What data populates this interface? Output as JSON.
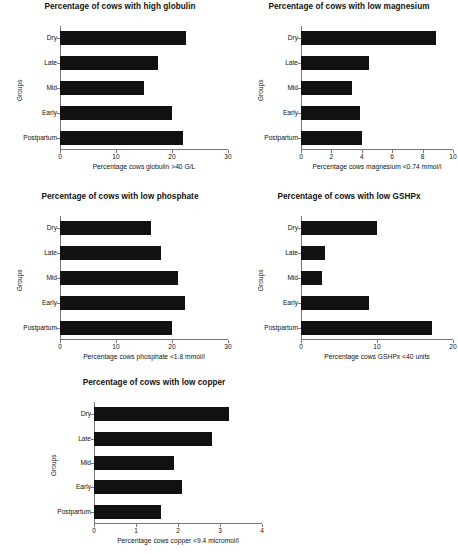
{
  "figure": {
    "groups_axis_label": "Groups",
    "categories": [
      "Dry",
      "Late",
      "Mid",
      "Early",
      "Postpartum"
    ]
  },
  "chart_data": [
    {
      "type": "bar",
      "orientation": "horizontal",
      "title": "Percentage of cows with high globulin",
      "xlabel": "Percentage cows globulin >40 G/L",
      "ylabel": "Groups",
      "categories": [
        "Dry",
        "Late",
        "Mid",
        "Early",
        "Postpartum"
      ],
      "values": [
        22.5,
        17.5,
        15.0,
        20.0,
        22.0
      ],
      "xlim": [
        0,
        30
      ],
      "xticks": [
        0,
        10,
        20,
        30
      ],
      "xtick_labels": [
        "0",
        "10",
        "20",
        "30"
      ],
      "grid": false,
      "legend": "none",
      "bar_color": "#111111"
    },
    {
      "type": "bar",
      "orientation": "horizontal",
      "title": "Percentage of cows with low magnesium",
      "xlabel": "Percentage cows magnesium <0.74 mmol/l",
      "ylabel": "Groups",
      "categories": [
        "Dry",
        "Late",
        "Mid",
        "Early",
        "Postpartum"
      ],
      "values": [
        8.9,
        4.5,
        3.35,
        3.85,
        4.0
      ],
      "xlim": [
        0,
        10
      ],
      "xticks": [
        0,
        2,
        4,
        6,
        8,
        10
      ],
      "xtick_labels": [
        "0",
        "2",
        "4",
        "6",
        "8",
        "10"
      ],
      "grid": false,
      "legend": "none",
      "bar_color": "#111111"
    },
    {
      "type": "bar",
      "orientation": "horizontal",
      "title": "Percentage of cows with low phosphate",
      "xlabel": "Percentage cows phosphate <1.8 mmol/l",
      "ylabel": "Groups",
      "categories": [
        "Dry",
        "Late",
        "Mid",
        "Early",
        "Postpartum"
      ],
      "values": [
        16.2,
        18.1,
        21.0,
        22.4,
        20.0
      ],
      "xlim": [
        0,
        30
      ],
      "xticks": [
        0,
        10,
        20,
        30
      ],
      "xtick_labels": [
        "0",
        "10",
        "20",
        "30"
      ],
      "grid": false,
      "legend": "none",
      "bar_color": "#111111"
    },
    {
      "type": "bar",
      "orientation": "horizontal",
      "title": "Percentage of cows with low GSHPx",
      "xlabel": "Percentage cows GSHPx <40 units",
      "ylabel": "Groups",
      "categories": [
        "Dry",
        "Late",
        "Mid",
        "Early",
        "Postpartum"
      ],
      "values": [
        10.0,
        3.2,
        2.7,
        9.0,
        17.3
      ],
      "xlim": [
        0,
        20
      ],
      "xticks": [
        0,
        10,
        20
      ],
      "xtick_labels": [
        "0",
        "10",
        "20"
      ],
      "grid": false,
      "legend": "none",
      "bar_color": "#111111"
    },
    {
      "type": "bar",
      "orientation": "horizontal",
      "title": "Percentage of cows with low copper",
      "xlabel": "Percentage cows copper <9.4 micromol/l",
      "ylabel": "Groups",
      "categories": [
        "Dry",
        "Late",
        "Mid",
        "Early",
        "Postpartum"
      ],
      "values": [
        3.22,
        2.8,
        1.9,
        2.1,
        1.6
      ],
      "xlim": [
        0,
        4
      ],
      "xticks": [
        0,
        1,
        2,
        3,
        4
      ],
      "xtick_labels": [
        "0",
        "1",
        "2",
        "3",
        "4"
      ],
      "grid": false,
      "legend": "none",
      "bar_color": "#111111"
    }
  ]
}
